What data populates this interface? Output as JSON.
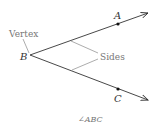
{
  "diagram": {
    "vertex_label": "B",
    "point_upper": "A",
    "point_lower": "C",
    "vertex_callout": "Vertex",
    "sides_callout": "Sides",
    "caption": "∠ABC",
    "colors": {
      "line": "#333333",
      "callout": "#888888",
      "point": "#111111"
    }
  }
}
